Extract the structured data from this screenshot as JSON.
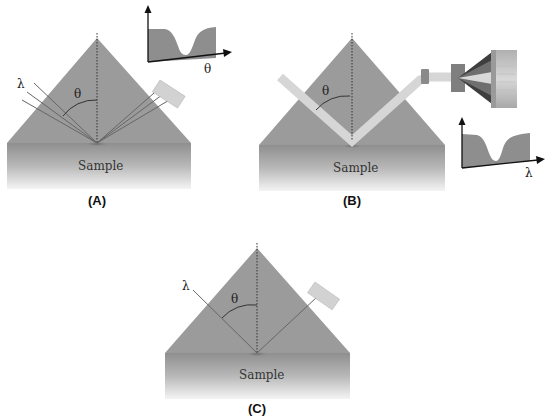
{
  "colors": {
    "prism": "#9b9b9b",
    "sample_top": "#8f8f8f",
    "sample_bottom": "#f2f2f2",
    "beam": "#d6d6d6",
    "detector": "#d0d0d0",
    "plot_fill": "#8e8e8e",
    "line": "#555555"
  },
  "panels": {
    "a": {
      "label": "(A)",
      "sample_label": "Sample",
      "incident_symbol": "λ",
      "angle_symbol": "θ",
      "inset_axis_label": "θ"
    },
    "b": {
      "label": "(B)",
      "sample_label": "Sample",
      "angle_symbol": "θ",
      "inset_axis_label": "λ"
    },
    "c": {
      "label": "(C)",
      "sample_label": "Sample",
      "incident_symbol": "λ",
      "angle_symbol": "θ"
    }
  }
}
